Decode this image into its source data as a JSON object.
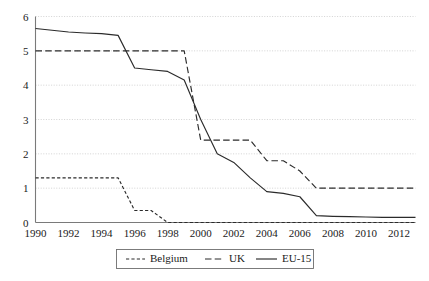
{
  "chart_data": {
    "type": "line",
    "title": "",
    "subtitle": "",
    "xlabel": "",
    "ylabel": "",
    "xlim": [
      1990,
      2013
    ],
    "ylim": [
      0,
      6
    ],
    "grid": true,
    "grid_axis": "y",
    "legend_position": "bottom",
    "x_tick_labels": [
      "1990",
      "1992",
      "1994",
      "1996",
      "1998",
      "2000",
      "2002",
      "2004",
      "2006",
      "2008",
      "2010",
      "2012"
    ],
    "x_ticks": [
      1990,
      1992,
      1994,
      1996,
      1998,
      2000,
      2002,
      2004,
      2006,
      2008,
      2010,
      2012
    ],
    "y_tick_labels": [
      "0",
      "1",
      "2",
      "3",
      "4",
      "5",
      "6"
    ],
    "y_ticks": [
      0,
      1,
      2,
      3,
      4,
      5,
      6
    ],
    "x": [
      1990,
      1991,
      1992,
      1993,
      1994,
      1995,
      1996,
      1997,
      1998,
      1999,
      2000,
      2001,
      2002,
      2003,
      2004,
      2005,
      2006,
      2007,
      2008,
      2009,
      2010,
      2011,
      2012,
      2013
    ],
    "series": [
      {
        "name": "Belgium",
        "style": "dotted-dash",
        "color": "#2b2b2b",
        "values": [
          1.3,
          1.3,
          1.3,
          1.3,
          1.3,
          1.3,
          0.35,
          0.35,
          0.0,
          0.0,
          0.0,
          0.0,
          0.0,
          0.0,
          0.0,
          0.0,
          0.0,
          0.0,
          0.0,
          0.0,
          0.0,
          0.0,
          0.0,
          0.0
        ]
      },
      {
        "name": "UK",
        "style": "dashed",
        "color": "#2b2b2b",
        "values": [
          5.0,
          5.0,
          5.0,
          5.0,
          5.0,
          5.0,
          5.0,
          5.0,
          5.0,
          5.0,
          2.4,
          2.4,
          2.4,
          2.4,
          1.8,
          1.8,
          1.5,
          1.0,
          1.0,
          1.0,
          1.0,
          1.0,
          1.0,
          1.0
        ]
      },
      {
        "name": "EU-15",
        "style": "solid",
        "color": "#2b2b2b",
        "values": [
          5.65,
          5.6,
          5.55,
          5.52,
          5.5,
          5.45,
          4.5,
          4.45,
          4.4,
          4.15,
          3.0,
          2.0,
          1.75,
          1.3,
          0.9,
          0.85,
          0.75,
          0.2,
          0.18,
          0.17,
          0.16,
          0.15,
          0.15,
          0.15
        ]
      }
    ]
  },
  "legend": {
    "entries": [
      {
        "label": "Belgium"
      },
      {
        "label": "UK"
      },
      {
        "label": "EU-15"
      }
    ]
  }
}
